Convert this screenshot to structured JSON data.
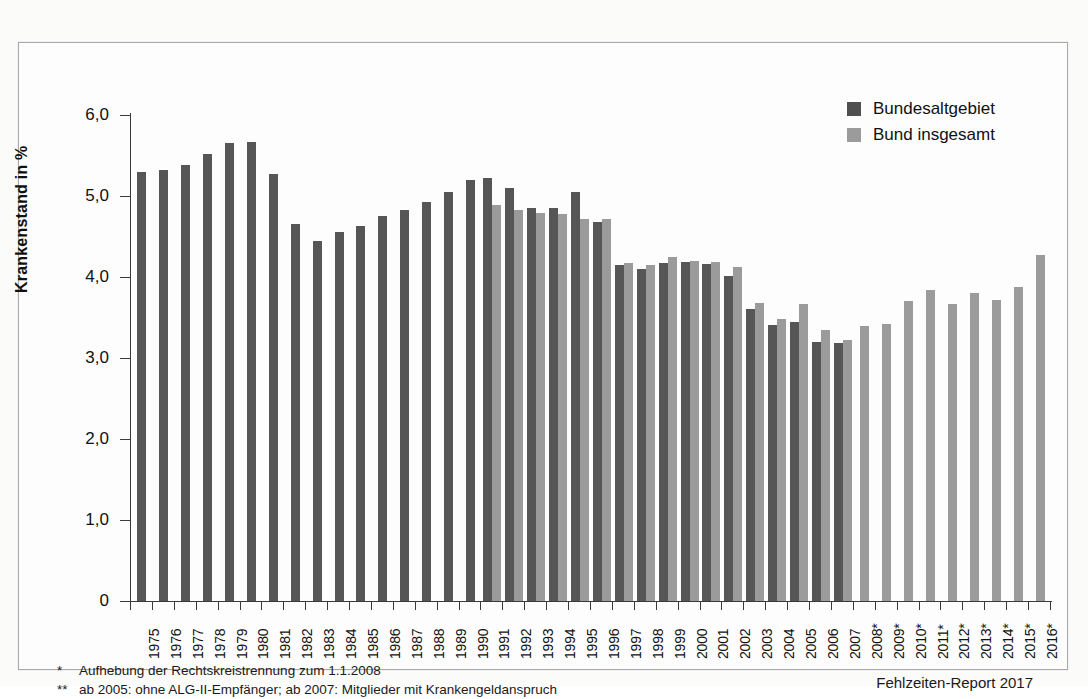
{
  "legend": {
    "items": [
      {
        "label": "Bundesaltgebiet",
        "color": "#4f4f4f",
        "key": "bundesaltgebiet"
      },
      {
        "label": "Bund insgesamt",
        "color": "#9b9b9b",
        "key": "bund_insgesamt"
      }
    ]
  },
  "axis": {
    "ylabel": "Krankenstand in %",
    "yticks": [
      "6,0",
      "5,0",
      "4,0",
      "3,0",
      "2,0",
      "1,0",
      "0"
    ]
  },
  "footnotes": [
    {
      "mark": "*",
      "text": "Aufhebung der Rechtskreistrennung zum 1.1.2008"
    },
    {
      "mark": "**",
      "text": "ab 2005: ohne ALG-II-Empfänger; ab 2007: Mitglieder mit Krankengeldanspruch"
    }
  ],
  "source": "Fehlzeiten-Report 2017",
  "chart_data": {
    "type": "bar",
    "title": "",
    "xlabel": "",
    "ylabel": "Krankenstand in %",
    "ylim": [
      0,
      6.0
    ],
    "ytick_values": [
      6.0,
      5.0,
      4.0,
      3.0,
      2.0,
      1.0,
      0
    ],
    "grid": false,
    "legend_position": "top-right",
    "categories": [
      "1975",
      "1976",
      "1977",
      "1978",
      "1979",
      "1980",
      "1981",
      "1982",
      "1983",
      "1984",
      "1985",
      "1986",
      "1987",
      "1988",
      "1989",
      "1990",
      "1991",
      "1992",
      "1993",
      "1994",
      "1995",
      "1996",
      "1997",
      "1998",
      "1999",
      "2000",
      "2001",
      "2002",
      "2003",
      "2004",
      "2005",
      "2006",
      "2007",
      "2008*",
      "2009*",
      "2010*",
      "2011*",
      "2012*",
      "2013*",
      "2014*",
      "2015*",
      "2016*"
    ],
    "series": [
      {
        "name": "Bundesaltgebiet",
        "color": "#565656",
        "values": [
          5.3,
          5.32,
          5.38,
          5.52,
          5.65,
          5.67,
          5.27,
          4.65,
          4.44,
          4.55,
          4.63,
          4.75,
          4.83,
          4.93,
          5.05,
          5.2,
          5.22,
          5.1,
          4.85,
          4.85,
          5.05,
          4.68,
          4.15,
          4.1,
          4.17,
          4.18,
          4.16,
          4.01,
          3.6,
          3.41,
          3.44,
          3.2,
          3.19,
          null,
          null,
          null,
          null,
          null,
          null,
          null,
          null,
          null
        ]
      },
      {
        "name": "Bund insgesamt",
        "color": "#9b9b9b",
        "values": [
          null,
          null,
          null,
          null,
          null,
          null,
          null,
          null,
          null,
          null,
          null,
          null,
          null,
          null,
          null,
          null,
          4.89,
          4.83,
          4.79,
          4.78,
          4.72,
          4.72,
          4.17,
          4.15,
          4.25,
          4.2,
          4.18,
          4.12,
          3.68,
          3.48,
          3.67,
          3.35,
          3.22,
          3.39,
          3.42,
          3.71,
          3.84,
          3.67,
          3.8,
          3.72,
          3.88,
          4.27
        ]
      }
    ]
  }
}
